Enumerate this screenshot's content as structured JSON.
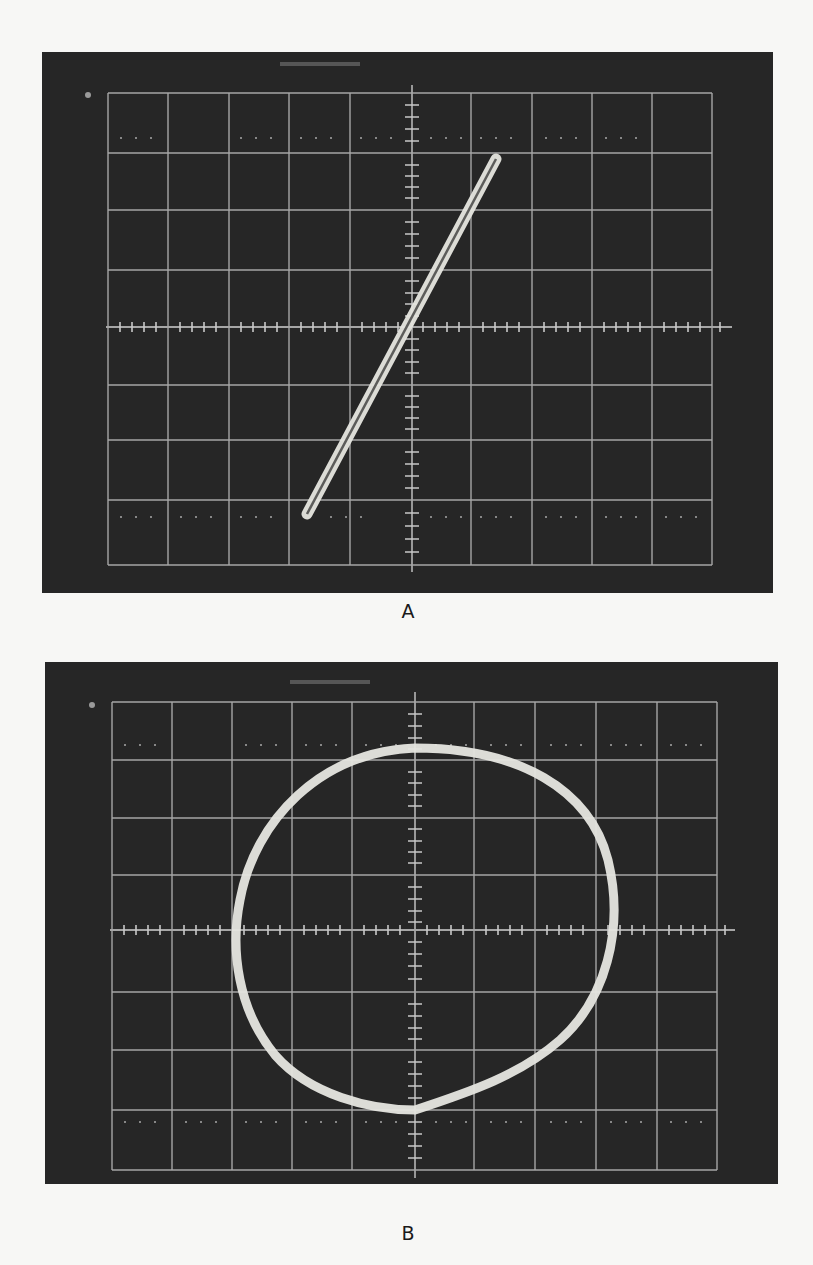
{
  "figure": {
    "panels": [
      {
        "label": "A",
        "description": "Oscilloscope display showing a narrow diagonal Lissajous trace (in-phase signals)",
        "trace_type": "narrow-ellipse-line",
        "trace_start": [
          306,
          515
        ],
        "trace_end": [
          496,
          158
        ]
      },
      {
        "label": "B",
        "description": "Oscilloscope display showing a near-circular Lissajous trace (90° phase difference)",
        "trace_type": "circle",
        "center": [
          424,
          927
        ],
        "rx": 190,
        "ry": 165
      }
    ]
  },
  "colors": {
    "screen": "#262626",
    "grid": "#bdbdbd",
    "trace": "#e6e6e0",
    "page": "#f7f7f5"
  }
}
